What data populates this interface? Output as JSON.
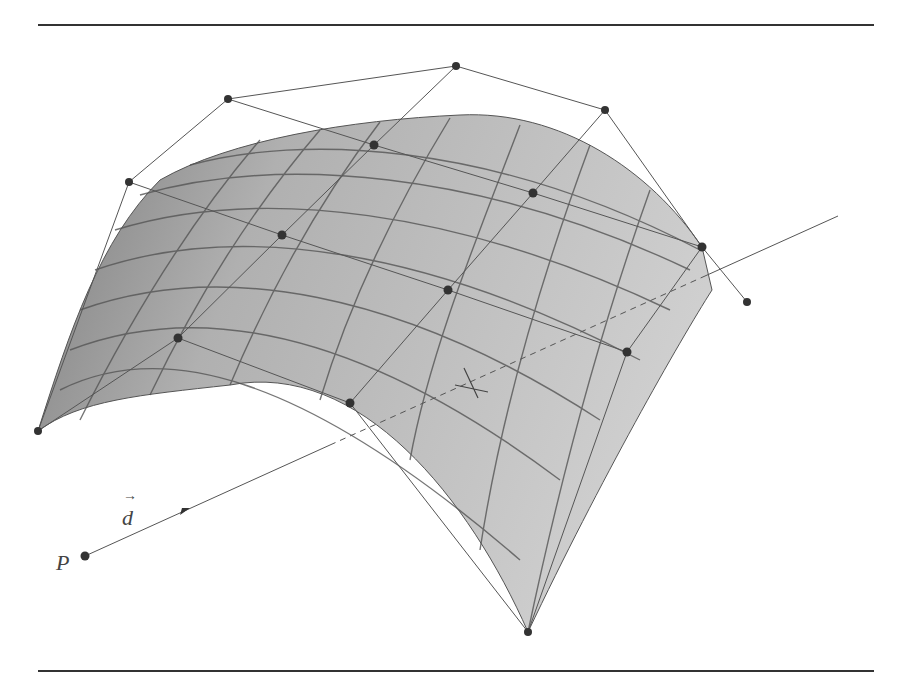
{
  "figure": {
    "labels": {
      "point": "P",
      "direction": "d"
    },
    "colors": {
      "surface_light": "#c8c8c8",
      "surface_dark": "#8a8a8a",
      "lines": "#444444",
      "points": "#333333"
    },
    "control_points": [
      [
        38,
        431
      ],
      [
        178,
        338
      ],
      [
        350,
        403
      ],
      [
        528,
        632
      ],
      [
        129,
        182
      ],
      [
        282,
        235
      ],
      [
        448,
        290
      ],
      [
        627,
        352
      ],
      [
        228,
        99
      ],
      [
        374,
        145
      ],
      [
        533,
        193
      ],
      [
        702,
        247
      ],
      [
        456,
        66
      ],
      [
        605,
        110
      ],
      [
        747,
        302
      ]
    ],
    "ray": {
      "start": [
        85,
        556
      ],
      "end": [
        838,
        216
      ]
    }
  }
}
